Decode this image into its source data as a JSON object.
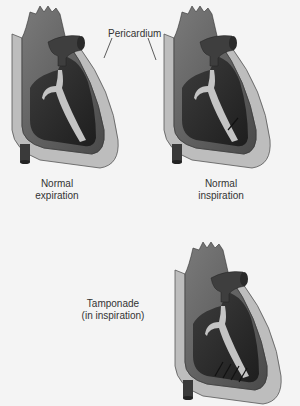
{
  "figure": {
    "callout_label": "Pericardium",
    "panels": [
      {
        "id": "normal-expiration",
        "label_line1": "Normal",
        "label_line2": "expiration"
      },
      {
        "id": "normal-inspiration",
        "label_line1": "Normal",
        "label_line2": "inspiration"
      },
      {
        "id": "tamponade",
        "label_line1": "Tamponade",
        "label_line2": "(in inspiration)"
      }
    ],
    "colors": {
      "background": "#f4f4f4",
      "pericardium": "#b8b8b8",
      "pericardium_edge": "#5a5a5a",
      "myocardium": "#6e6e6e",
      "chamber": "#2e2e2e",
      "septum": "#c4c4c4",
      "vessel": "#4a4a4a"
    }
  }
}
